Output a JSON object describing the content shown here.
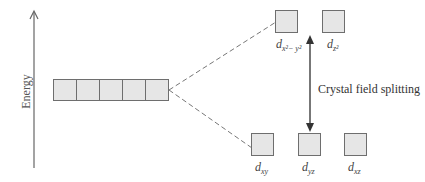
{
  "diagram": {
    "type": "crystal-field-splitting",
    "axis_label": "Energy",
    "annotation": "Crystal field splitting",
    "degenerate_set": {
      "count": 5,
      "label": ""
    },
    "upper_orbitals": [
      {
        "label": "d",
        "subscript": "x²− y²"
      },
      {
        "label": "d",
        "subscript": "z²"
      }
    ],
    "lower_orbitals": [
      {
        "label": "d",
        "subscript": "xy"
      },
      {
        "label": "d",
        "subscript": "yz"
      },
      {
        "label": "d",
        "subscript": "xz"
      }
    ],
    "colors": {
      "box_fill": "#e6e6e6",
      "box_border": "#6e6e6e",
      "arrow": "#555555",
      "dashed_line": "#777777"
    }
  }
}
